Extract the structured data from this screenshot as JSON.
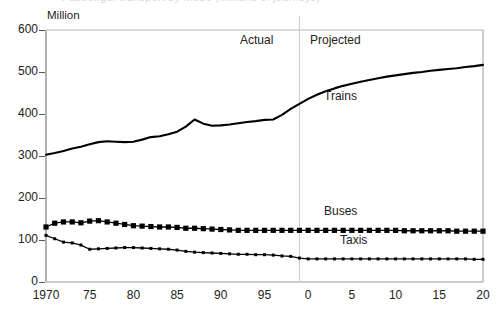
{
  "title_clipped": "Passenger transport by mode (millions of journeys)",
  "axis": {
    "unit_label": "Million",
    "y_ticks": [
      0,
      100,
      200,
      300,
      400,
      500,
      600
    ],
    "x_ticks": [
      "1970",
      "75",
      "80",
      "85",
      "90",
      "95",
      "0",
      "5",
      "10",
      "15",
      "20"
    ],
    "x_tick_values": [
      1970,
      1975,
      1980,
      1985,
      1990,
      1995,
      2000,
      2005,
      2010,
      2015,
      2020
    ]
  },
  "regions": [
    {
      "name": "actual-region-label",
      "label": "Actual"
    },
    {
      "name": "projected-region-label",
      "label": "Projected"
    }
  ],
  "series_labels": {
    "trains": "Trains",
    "buses": "Buses",
    "taxis": "Taxis"
  },
  "colors": {
    "line": "#000000",
    "axis": "#666666",
    "divider": "#cccccc",
    "background": "#ffffff"
  },
  "chart_data": {
    "type": "line",
    "title": "Passenger transport by mode (millions of journeys)",
    "xlabel": "",
    "ylabel": "Million",
    "xlim": [
      1970,
      2020
    ],
    "ylim": [
      0,
      600
    ],
    "grid": false,
    "legend": "inline-annotations",
    "annotations": [
      {
        "text": "Actual",
        "x": 1987,
        "y": 570
      },
      {
        "text": "Projected",
        "x": 2002,
        "y": 570
      },
      {
        "text": "Trains",
        "x": 2004,
        "y": 430
      },
      {
        "text": "Buses",
        "x": 2004,
        "y": 160
      },
      {
        "text": "Taxis",
        "x": 2004,
        "y": 115
      }
    ],
    "divider_x": 1999,
    "x": [
      1970,
      1971,
      1972,
      1973,
      1974,
      1975,
      1976,
      1977,
      1978,
      1979,
      1980,
      1981,
      1982,
      1983,
      1984,
      1985,
      1986,
      1987,
      1988,
      1989,
      1990,
      1991,
      1992,
      1993,
      1994,
      1995,
      1996,
      1997,
      1998,
      1999,
      2000,
      2001,
      2002,
      2003,
      2004,
      2005,
      2006,
      2007,
      2008,
      2009,
      2010,
      2011,
      2012,
      2013,
      2014,
      2015,
      2016,
      2017,
      2018,
      2019,
      2020
    ],
    "series": [
      {
        "name": "Trains",
        "marker": "none",
        "values": [
          303,
          307,
          312,
          318,
          322,
          328,
          333,
          335,
          334,
          333,
          334,
          339,
          345,
          347,
          352,
          358,
          370,
          387,
          377,
          372,
          373,
          375,
          378,
          381,
          383,
          386,
          387,
          398,
          412,
          424,
          436,
          446,
          454,
          461,
          467,
          472,
          477,
          481,
          485,
          489,
          492,
          495,
          498,
          500,
          503,
          505,
          507,
          509,
          512,
          514,
          517
        ]
      },
      {
        "name": "Buses",
        "marker": "square",
        "values": [
          131,
          140,
          143,
          143,
          141,
          145,
          146,
          143,
          140,
          137,
          134,
          133,
          132,
          131,
          131,
          130,
          128,
          128,
          127,
          126,
          125,
          124,
          123,
          123,
          123,
          123,
          123,
          123,
          123,
          123,
          123,
          123,
          123,
          123,
          123,
          123,
          123,
          123,
          123,
          123,
          123,
          122,
          122,
          122,
          122,
          122,
          122,
          121,
          121,
          121,
          121
        ]
      },
      {
        "name": "Taxis",
        "marker": "dot",
        "values": [
          111,
          103,
          95,
          93,
          88,
          78,
          79,
          80,
          81,
          82,
          82,
          81,
          80,
          79,
          78,
          76,
          73,
          71,
          70,
          69,
          68,
          67,
          66,
          66,
          65,
          65,
          64,
          62,
          61,
          57,
          55,
          55,
          55,
          55,
          55,
          55,
          55,
          55,
          55,
          55,
          55,
          55,
          55,
          55,
          55,
          55,
          55,
          55,
          55,
          54,
          54
        ]
      }
    ]
  }
}
